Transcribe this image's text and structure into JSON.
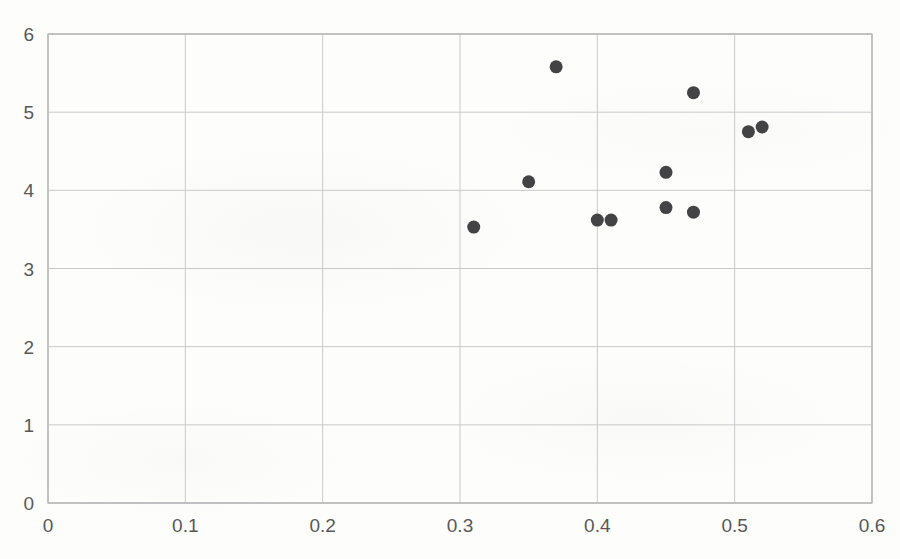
{
  "chart_data": {
    "type": "scatter",
    "title": "",
    "subtitle": "",
    "xlabel": "",
    "ylabel": "",
    "xlim": [
      0,
      0.6
    ],
    "ylim": [
      0,
      6
    ],
    "grid": true,
    "legend": null,
    "legend_position": "none",
    "marker": {
      "shape": "circle",
      "color": "#434345",
      "size_px": 13
    },
    "x_ticks": [
      0,
      0.1,
      0.2,
      0.3,
      0.4,
      0.5,
      0.6
    ],
    "x_tick_labels": [
      "0",
      "0.1",
      "0.2",
      "0.3",
      "0.4",
      "0.5",
      "0.6"
    ],
    "y_ticks": [
      0,
      1,
      2,
      3,
      4,
      5,
      6
    ],
    "y_tick_labels": [
      "0",
      "1",
      "2",
      "3",
      "4",
      "5",
      "6"
    ],
    "series": [
      {
        "name": "series-1",
        "color": "#434345",
        "points": [
          {
            "x": 0.31,
            "y": 3.53
          },
          {
            "x": 0.35,
            "y": 4.11
          },
          {
            "x": 0.37,
            "y": 5.58
          },
          {
            "x": 0.4,
            "y": 3.62
          },
          {
            "x": 0.41,
            "y": 3.62
          },
          {
            "x": 0.45,
            "y": 4.23
          },
          {
            "x": 0.45,
            "y": 3.78
          },
          {
            "x": 0.47,
            "y": 5.25
          },
          {
            "x": 0.47,
            "y": 3.72
          },
          {
            "x": 0.51,
            "y": 4.75
          },
          {
            "x": 0.52,
            "y": 4.81
          }
        ]
      }
    ]
  },
  "plot_area": {
    "left_px": 48,
    "right_px": 872,
    "top_px": 34,
    "bottom_px": 503
  },
  "colors": {
    "background": "#fdfdfc",
    "gridline": "#c9c9cb",
    "border": "#bdbdbf",
    "tick_text": "#58585a",
    "marker": "#434345"
  }
}
